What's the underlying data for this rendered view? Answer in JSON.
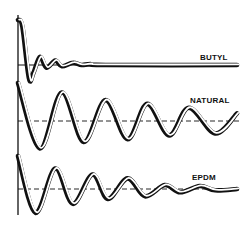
{
  "chart_data": {
    "type": "line",
    "title": "",
    "xlabel": "",
    "ylabel": "",
    "grid": false,
    "x_range": [
      0,
      100
    ],
    "y_range": [
      -1,
      1
    ],
    "colors": {
      "ink": "#111111",
      "paper": "#ffffff"
    },
    "series": [
      {
        "name": "BUTYL",
        "label": "BUTYL",
        "points": [
          [
            0,
            1.0
          ],
          [
            2,
            0.85
          ],
          [
            5,
            -0.3
          ],
          [
            7,
            -0.18
          ],
          [
            10,
            0.18
          ],
          [
            13,
            -0.06
          ],
          [
            17,
            0.1
          ],
          [
            20,
            -0.03
          ],
          [
            25,
            0.05
          ],
          [
            29,
            0.0
          ],
          [
            33,
            0.02
          ],
          [
            40,
            0.0
          ],
          [
            100,
            0.0
          ]
        ]
      },
      {
        "name": "NATURAL",
        "label": "NATURAL",
        "points": [
          [
            0,
            1.0
          ],
          [
            10,
            -0.72
          ],
          [
            20,
            0.75
          ],
          [
            30,
            -0.55
          ],
          [
            40,
            0.55
          ],
          [
            50,
            -0.48
          ],
          [
            59,
            0.45
          ],
          [
            69,
            -0.38
          ],
          [
            78,
            0.35
          ],
          [
            90,
            -0.33
          ],
          [
            100,
            0.2
          ]
        ]
      },
      {
        "name": "EPDM",
        "label": "EPDM",
        "points": [
          [
            0,
            1.0
          ],
          [
            8,
            -0.72
          ],
          [
            17,
            0.62
          ],
          [
            25,
            -0.45
          ],
          [
            34,
            0.44
          ],
          [
            41,
            -0.3
          ],
          [
            50,
            0.32
          ],
          [
            58,
            -0.22
          ],
          [
            67,
            0.12
          ],
          [
            74,
            -0.1
          ],
          [
            83,
            0.09
          ],
          [
            90,
            -0.04
          ],
          [
            100,
            0.0
          ]
        ]
      }
    ]
  }
}
